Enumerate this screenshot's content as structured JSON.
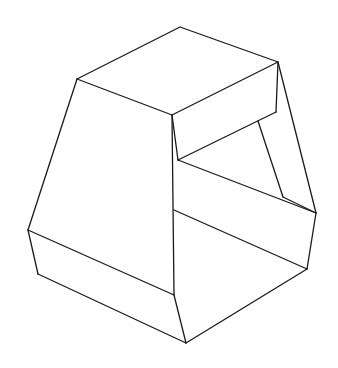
{
  "figure": {
    "stroke_color": "#1a1a1a",
    "background": "#ffffff",
    "vertices": {
      "top": [
        180,
        27
      ],
      "top_left": [
        77,
        79
      ],
      "top_right": [
        278,
        62
      ],
      "top_front": [
        172,
        115
      ],
      "box_bottom_front": [
        178,
        160
      ],
      "box_bottom_right": [
        276,
        112
      ],
      "inner_start": [
        258,
        121
      ],
      "inner_kink": [
        283,
        197
      ],
      "far_right": [
        316,
        213
      ],
      "right_lower": [
        307,
        269
      ],
      "left_mid": [
        28,
        230
      ],
      "left_bottom": [
        38,
        274
      ],
      "center_mid": [
        174,
        210
      ],
      "center_low": [
        174,
        295
      ],
      "bottom": [
        186,
        343
      ]
    }
  }
}
